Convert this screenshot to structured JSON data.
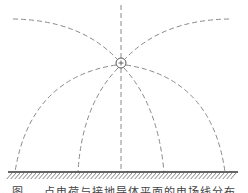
{
  "figure": {
    "type": "field-lines-point-charge-above-grounded-plane",
    "charge": {
      "symbol": "+",
      "cx": 121,
      "cy": 63,
      "r": 5
    },
    "ground": {
      "y": 172,
      "x1": 8,
      "x2": 238,
      "hatch_depth": 7
    },
    "colors": {
      "field_line": "#8a8a8a",
      "ground": "#333333",
      "charge": "#555555"
    },
    "field_lines": [
      {
        "name": "vertical-up",
        "d": "M121 5 L121 58"
      },
      {
        "name": "upper-left-arc",
        "d": "M13 19 Q80 20 117 59"
      },
      {
        "name": "upper-right-arc",
        "d": "M229 19 Q162 20 125 59"
      },
      {
        "name": "outer-left-arc",
        "d": "M116 65 Q30 78 15 172"
      },
      {
        "name": "inner-left-arc",
        "d": "M118 68 Q82 105 78 172"
      },
      {
        "name": "vertical-down",
        "d": "M121 68 L121 172"
      },
      {
        "name": "inner-right-arc",
        "d": "M124 68 Q158 105 164 172"
      },
      {
        "name": "outer-right-arc",
        "d": "M126 65 Q212 78 225 172"
      }
    ]
  },
  "caption": "图 — 点电荷与接地导体平面的电场线分布"
}
